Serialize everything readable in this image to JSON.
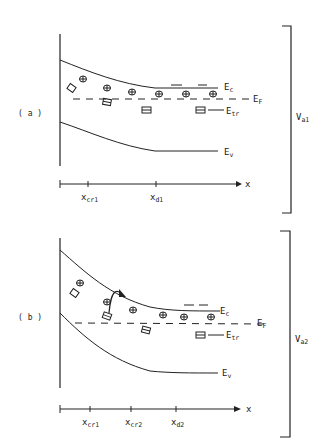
{
  "panels": [
    {
      "id": "a",
      "label": "( a )",
      "bands": {
        "conduction": {
          "label": "E",
          "sub": "c"
        },
        "fermi": {
          "label": "E",
          "sub": "F"
        },
        "trap": {
          "label": "E",
          "sub": "tr"
        },
        "valence": {
          "label": "E",
          "sub": "v"
        }
      },
      "voltage": {
        "label": "V",
        "sub": "a1"
      },
      "axis": {
        "label": "x",
        "ticks": [
          {
            "label": "x",
            "sub": "cr1"
          },
          {
            "label": "x",
            "sub": "d1"
          }
        ]
      },
      "electron_symbol": "⊖",
      "electron_count": 6,
      "trap_symbol": "⊟",
      "trap_count": 4
    },
    {
      "id": "b",
      "label": "( b )",
      "bands": {
        "conduction": {
          "label": "E",
          "sub": "c"
        },
        "fermi": {
          "label": "E",
          "sub": "F"
        },
        "trap": {
          "label": "E",
          "sub": "tr"
        },
        "valence": {
          "label": "E",
          "sub": "v"
        }
      },
      "voltage": {
        "label": "V",
        "sub": "a2"
      },
      "axis": {
        "label": "x",
        "ticks": [
          {
            "label": "x",
            "sub": "cr1"
          },
          {
            "label": "x",
            "sub": "cr2"
          },
          {
            "label": "x",
            "sub": "d2"
          }
        ]
      },
      "electron_symbol": "⊖",
      "electron_count": 6,
      "trap_symbol": "⊟",
      "trap_count": 4,
      "emission_arrow": true
    }
  ]
}
